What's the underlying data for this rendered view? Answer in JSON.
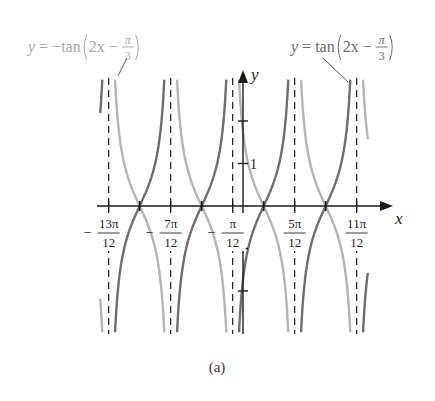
{
  "chart_data": {
    "type": "line",
    "title": "",
    "caption": "(a)",
    "xlabel": "x",
    "ylabel": "y",
    "x_range_units_of_pi": [
      -1.25,
      1.0
    ],
    "ylim": [
      -3,
      3
    ],
    "grid": false,
    "series": [
      {
        "name": "y = tan(2x − π/3)",
        "expression": "tan(2*x - pi/3)",
        "color": "#6e6e6e",
        "label_parts": {
          "lhs": "y = tan",
          "inner": "2x −",
          "num": "π",
          "den": "3"
        }
      },
      {
        "name": "y = −tan(2x − π/3)",
        "expression": "-tan(2*x - pi/3)",
        "color": "#b4b4b4",
        "label_parts": {
          "lhs": "y = −tan",
          "inner": "2x −",
          "num": "π",
          "den": "3"
        }
      }
    ],
    "asymptotes": [
      {
        "x_over_pi": -1.0833,
        "label_sign": "−",
        "label_num": "13π",
        "label_den": "12"
      },
      {
        "x_over_pi": -0.5833,
        "label_sign": "−",
        "label_num": "7π",
        "label_den": "12"
      },
      {
        "x_over_pi": -0.0833,
        "label_sign": "−",
        "label_num": "π",
        "label_den": "12"
      },
      {
        "x_over_pi": 0.4167,
        "label_sign": "",
        "label_num": "5π",
        "label_den": "12"
      },
      {
        "x_over_pi": 0.9167,
        "label_sign": "",
        "label_num": "11π",
        "label_den": "12"
      }
    ],
    "zeros_over_pi": [
      -0.8333,
      -0.3333,
      0.1667,
      0.6667
    ],
    "y_ticks": [
      -2,
      -1,
      1,
      2
    ],
    "y_tick_labels": [
      {
        "value": 1,
        "text": "1"
      }
    ]
  },
  "colors": {
    "axis": "#1a1a1a",
    "dark_curve": "#6e6e6e",
    "light_curve": "#b4b4b4",
    "label_light": "#a8a8a8",
    "label_dark": "#6a6a6a"
  }
}
